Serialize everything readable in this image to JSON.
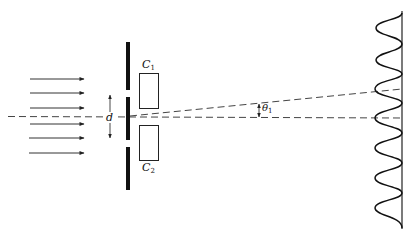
{
  "figure": {
    "type": "double-slit-experiment",
    "labels": {
      "collimator_top": {
        "main": "C",
        "sub": "1"
      },
      "collimator_bottom": {
        "main": "C",
        "sub": "2"
      },
      "slit_separation": "d",
      "angle": {
        "main": "θ",
        "sub": "1"
      }
    },
    "incident_arrows": 6,
    "screen_pattern_peaks": 7,
    "colors": {
      "ink": "#111111",
      "background": "#ffffff"
    }
  }
}
